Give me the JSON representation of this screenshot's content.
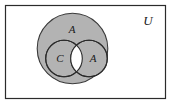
{
  "diagram": {
    "type": "venn-diagram",
    "title": "",
    "universe": {
      "label": "U",
      "label_x": 148,
      "label_y": 21,
      "rect": {
        "x": 5,
        "y": 5,
        "width": 161,
        "height": 94
      },
      "border_color": "#2b2b2b",
      "fill_color": "#ffffff"
    },
    "outer_circle": {
      "label": "A",
      "label_x": 72,
      "label_y": 30,
      "cx": 72.5,
      "cy": 48.5,
      "r": 35.5,
      "fill_color": "#b3b3b3",
      "stroke_color": "#3a3a3a"
    },
    "inner_circles": [
      {
        "label": "C",
        "label_x": 61,
        "label_y": 60,
        "cx": 64,
        "cy": 58.5,
        "r": 18.5,
        "fill_color": "#b3b3b3",
        "stroke_color": "#2b2b2b"
      },
      {
        "label": "A",
        "label_x": 93,
        "label_y": 60,
        "cx": 89,
        "cy": 58.5,
        "r": 18.5,
        "fill_color": "#b3b3b3",
        "stroke_color": "#2b2b2b"
      }
    ],
    "intersection": {
      "name": "lens",
      "fill_color": "#ffffff",
      "stroke_color": "#2b2b2b"
    }
  }
}
